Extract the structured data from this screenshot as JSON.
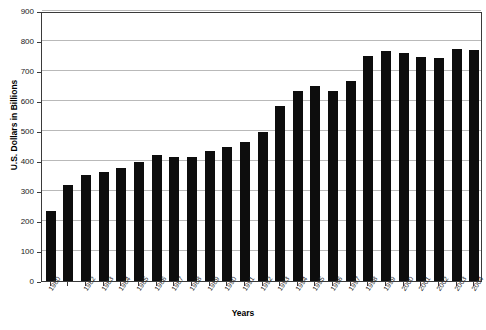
{
  "chart_data": {
    "type": "bar",
    "title": "",
    "xlabel": "Years",
    "ylabel": "U.S. Dollars in Billions",
    "ylim": [
      0,
      900
    ],
    "ytick_step": 100,
    "yticks": [
      0,
      100,
      200,
      300,
      400,
      500,
      600,
      700,
      800,
      900
    ],
    "grid": true,
    "legend": "none",
    "bar_color": "#0d0d0d",
    "categories": [
      "1980",
      "1981",
      "1982",
      "1983",
      "1984",
      "1985",
      "1986",
      "1987",
      "1988",
      "1989",
      "1990",
      "1991",
      "1992",
      "1993",
      "1994",
      "1995",
      "1996",
      "1997",
      "1998",
      "1999",
      "2000",
      "2001",
      "2002",
      "2003",
      "2004"
    ],
    "tick_labels": [
      "1980",
      "",
      "1982",
      "1983",
      "1984",
      "1985",
      "1986",
      "1987",
      "1988",
      "1989",
      "1990",
      "1991",
      "1992",
      "1993",
      "1994",
      "1995",
      "1996",
      "1997",
      "1998",
      "1999",
      "2000",
      "2001",
      "2002",
      "2003",
      "2004"
    ],
    "values": [
      233,
      320,
      353,
      363,
      378,
      397,
      420,
      412,
      413,
      433,
      447,
      463,
      497,
      585,
      633,
      650,
      635,
      668,
      750,
      768,
      760,
      748,
      745,
      775,
      770
    ]
  }
}
